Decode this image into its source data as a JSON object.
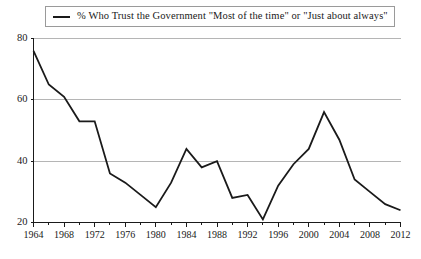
{
  "legend": {
    "marker": "line-sample-icon",
    "label": "% Who Trust the Government \"Most of the time\" or \"Just about always\""
  },
  "chart_data": {
    "type": "line",
    "title": "",
    "subtitle": "",
    "xlabel": "",
    "ylabel": "",
    "xlim": [
      1964,
      2012
    ],
    "ylim": [
      20,
      80
    ],
    "grid": true,
    "grid_axis": "y",
    "legend_position": "top",
    "line_color": "#1a1a1a",
    "background_color": "#ffffff",
    "grid_color": "#b5b5b5",
    "axis_color": "#1a1a1a",
    "y_ticks": [
      20,
      40,
      60,
      80
    ],
    "x_ticks": [
      1964,
      1968,
      1972,
      1976,
      1980,
      1984,
      1988,
      1992,
      1996,
      2000,
      2004,
      2008,
      2012
    ],
    "x_minor_tick_interval": 2,
    "series": [
      {
        "name": "% Who Trust the Government \"Most of the time\" or \"Just about always\"",
        "x": [
          1964,
          1966,
          1968,
          1970,
          1972,
          1974,
          1976,
          1978,
          1980,
          1982,
          1984,
          1986,
          1988,
          1990,
          1992,
          1994,
          1996,
          1998,
          2000,
          2002,
          2004,
          2006,
          2008,
          2010,
          2012
        ],
        "values": [
          76,
          65,
          61,
          53,
          53,
          36,
          33,
          29,
          25,
          33,
          44,
          38,
          40,
          28,
          29,
          21,
          32,
          39,
          44,
          56,
          47,
          34,
          30,
          26,
          24
        ]
      }
    ]
  }
}
